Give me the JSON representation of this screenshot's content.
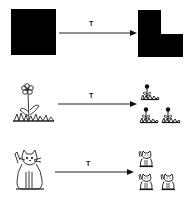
{
  "diagram": {
    "rows": [
      {
        "source": "black-square",
        "transform_label": "T",
        "result": "black-l-shape"
      },
      {
        "source": "flower",
        "transform_label": "T",
        "result": "three-small-flowers"
      },
      {
        "source": "cat",
        "transform_label": "T",
        "result": "three-small-cats"
      }
    ],
    "colors": {
      "ink": "#000000",
      "background": "#ffffff"
    }
  }
}
